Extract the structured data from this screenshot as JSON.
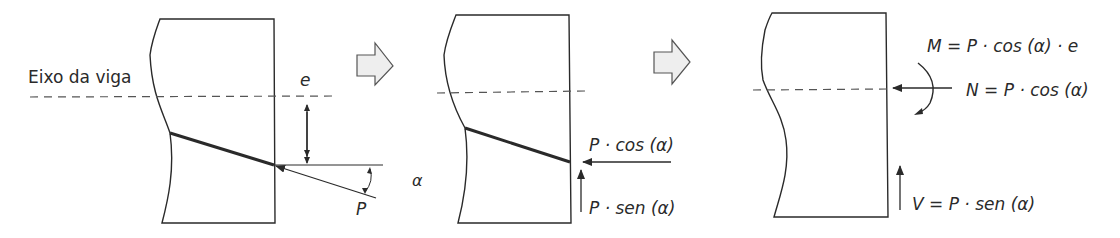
{
  "diagram": {
    "panel1": {
      "axis_label": "Eixo da viga",
      "eccentricity_label": "e",
      "force_label": "P",
      "angle_label": "α"
    },
    "panel2": {
      "horizontal_component": "P · cos (α)",
      "vertical_component": "P · sen (α)"
    },
    "panel3": {
      "moment": "M = P · cos (α) · e",
      "normal": "N = P · cos (α)",
      "shear": "V = P · sen (α)"
    },
    "colors": {
      "stroke": "#2a2a2a",
      "dashed": "#555555",
      "arrow_fill": "#eeeeee",
      "arrow_stroke": "#555555"
    }
  }
}
